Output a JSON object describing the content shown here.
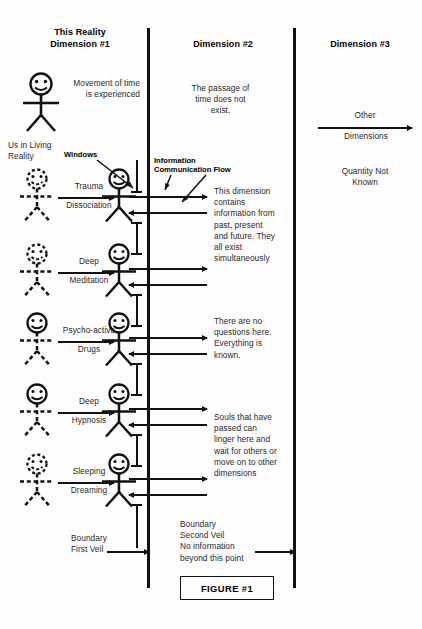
{
  "figure": {
    "caption": "FIGURE #1"
  },
  "columns": {
    "dim1": {
      "title": "This Reality\nDimension #1"
    },
    "dim2": {
      "title": "Dimension #2"
    },
    "dim3": {
      "title": "Dimension #3"
    }
  },
  "dim1": {
    "movement_of_time": "Movement of time\nis experienced",
    "us_in_living_reality": "Us in Living\nReality",
    "windows_label": "Windows",
    "boundary_first_veil": "Boundary\nFirst Veil"
  },
  "dim2": {
    "passage_of_time": "The passage of\ntime does not\nexist.",
    "info_flow_label": "Information\nCommunication Flow",
    "contains_info": "This dimension\ncontains\ninformation from\npast, present\nand future. They\nall exist\nsimultaneously",
    "no_questions": "There are no\nquestions here.\nEverything is\nknown.",
    "souls": "Souls that have\npassed can\nlinger here and\nwait for others or\nmove on to other\ndimensions",
    "boundary_second_veil": "Boundary\nSecond Veil\nNo information\nbeyond this point"
  },
  "dim3": {
    "other_dimensions_top": "Other",
    "other_dimensions_bottom": "Dimensions",
    "quantity_not_known": "Quantity Not\nKnown"
  },
  "transitions": [
    {
      "top": "Trauma",
      "bottom": "Dissociation"
    },
    {
      "top": "Deep",
      "bottom": "Meditation"
    },
    {
      "top": "Psycho-active",
      "bottom": "Drugs"
    },
    {
      "top": "Deep",
      "bottom": "Hypnosis"
    },
    {
      "top": "Sleeping",
      "bottom": "Dreaming"
    }
  ],
  "colors": {
    "ink": "#111111",
    "text": "#2a2a2a",
    "background": "#fefefe"
  }
}
